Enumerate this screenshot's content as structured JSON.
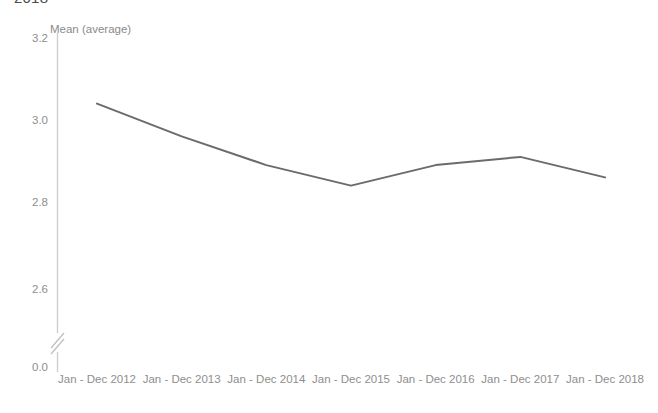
{
  "title": "2018",
  "yaxis": {
    "label": "Mean (average)",
    "ticks": [
      "3.2",
      "3.0",
      "2.8",
      "2.6",
      "0.0"
    ],
    "has_break": true
  },
  "colors": {
    "line": "#6b6b6b",
    "axis": "#cfcfcf",
    "text": "#8e8e8e",
    "title": "#4a4a4a",
    "background": "#ffffff"
  },
  "chart_data": {
    "type": "line",
    "title": "2018",
    "xlabel": "",
    "ylabel": "Mean (average)",
    "categories": [
      "Jan - Dec 2012",
      "Jan - Dec 2013",
      "Jan - Dec 2014",
      "Jan - Dec 2015",
      "Jan - Dec 2016",
      "Jan - Dec 2017",
      "Jan - Dec 2018"
    ],
    "values": [
      3.04,
      2.96,
      2.89,
      2.84,
      2.89,
      2.91,
      2.86
    ],
    "ylim": [
      2.5,
      3.26
    ],
    "yticks": [
      3.2,
      3.0,
      2.8,
      2.6
    ],
    "axis_break_tick": 0.0,
    "grid": false,
    "legend": "none",
    "series": [
      {
        "name": "Mean (average)",
        "values": [
          3.04,
          2.96,
          2.89,
          2.84,
          2.89,
          2.91,
          2.86
        ]
      }
    ]
  }
}
